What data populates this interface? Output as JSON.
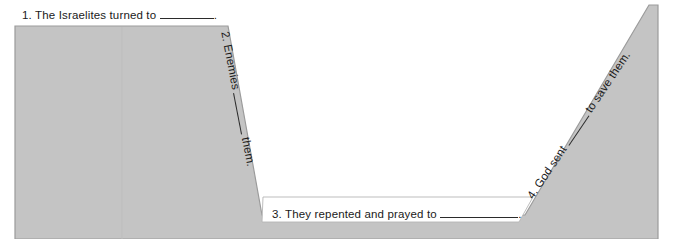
{
  "diagram": {
    "shape_name": "valley-polygon",
    "fill_color": "#c4c4c4",
    "stroke_color": "#8d8d8d",
    "background_color": "#ffffff",
    "text_color": "#1a1a1a"
  },
  "steps": [
    {
      "number": "1.",
      "text_before": "The Israelites turned to",
      "text_after": ".",
      "position": "top-left-plateau",
      "blank": true
    },
    {
      "number": "2.",
      "text_before": "Enemies",
      "text_after": "them.",
      "position": "left-descending-slope",
      "blank": true
    },
    {
      "number": "3.",
      "text_before": "They repented and prayed to",
      "text_after": ".",
      "position": "valley-floor",
      "blank": true
    },
    {
      "number": "4.",
      "text_before": "God sent",
      "text_after": "to save them.",
      "position": "right-ascending-slope",
      "blank": true
    }
  ]
}
